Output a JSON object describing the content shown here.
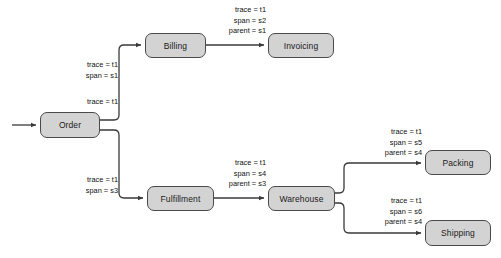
{
  "diagram": {
    "background_color": "#ffffff",
    "node_fill_color": "#d3d3d3",
    "node_border_color": "#4a4a4a",
    "edge_color": "#3a3a3a",
    "nodes": [
      {
        "id": "order",
        "label": "Order",
        "x": 40,
        "y": 112,
        "w": 60,
        "h": 26
      },
      {
        "id": "billing",
        "label": "Billing",
        "x": 145,
        "y": 33,
        "w": 61,
        "h": 25
      },
      {
        "id": "invoicing",
        "label": "Invoicing",
        "x": 268,
        "y": 33,
        "w": 66,
        "h": 25
      },
      {
        "id": "fulfillment",
        "label": "Fulfillment",
        "x": 147,
        "y": 186,
        "w": 67,
        "h": 25
      },
      {
        "id": "warehouse",
        "label": "Warehouse",
        "x": 268,
        "y": 186,
        "w": 67,
        "h": 25
      },
      {
        "id": "packing",
        "label": "Packing",
        "x": 425,
        "y": 150,
        "w": 66,
        "h": 25
      },
      {
        "id": "shipping",
        "label": "Shipping",
        "x": 425,
        "y": 220,
        "w": 66,
        "h": 26
      }
    ],
    "edge_labels": [
      {
        "id": "entry-order",
        "lines": [
          "trace = t1"
        ],
        "x": 56,
        "y": 97,
        "width": 62,
        "align": "right"
      },
      {
        "id": "order-billing",
        "lines": [
          "trace = t1",
          "span = s1"
        ],
        "x": 56,
        "y": 60,
        "width": 62,
        "align": "right"
      },
      {
        "id": "billing-invoicing",
        "lines": [
          "trace = t1",
          "span = s2",
          "parent = s1"
        ],
        "x": 196,
        "y": 5,
        "width": 70,
        "align": "right"
      },
      {
        "id": "order-fulfillment",
        "lines": [
          "trace = t1",
          "span = s3"
        ],
        "x": 56,
        "y": 175,
        "width": 62,
        "align": "right"
      },
      {
        "id": "fulfillment-warehouse",
        "lines": [
          "trace = t1",
          "span = s4",
          "parent = s3"
        ],
        "x": 196,
        "y": 158,
        "width": 70,
        "align": "right"
      },
      {
        "id": "warehouse-packing",
        "lines": [
          "trace = t1",
          "span = s5",
          "parent = s4"
        ],
        "x": 352,
        "y": 127,
        "width": 70,
        "align": "right"
      },
      {
        "id": "warehouse-shipping",
        "lines": [
          "trace = t1",
          "span = s6",
          "parent = s4"
        ],
        "x": 352,
        "y": 196,
        "width": 70,
        "align": "right"
      }
    ],
    "edges": [
      {
        "id": "entry-to-order",
        "from": "",
        "to": "order",
        "path": "M 12 125 L 36 125"
      },
      {
        "id": "order-to-billing",
        "from": "order",
        "to": "billing",
        "path": "M 100 120 L 114 120 Q 119 120 119 115 L 119 50 Q 119 45 124 45 L 141 45"
      },
      {
        "id": "billing-to-invoicing",
        "from": "billing",
        "to": "invoicing",
        "path": "M 206 45 L 264 45"
      },
      {
        "id": "order-to-fulfillment",
        "from": "order",
        "to": "fulfillment",
        "path": "M 100 130 L 114 130 Q 119 130 119 135 L 119 193 Q 119 198 124 198 L 143 198"
      },
      {
        "id": "fulfillment-to-warehouse",
        "from": "fulfillment",
        "to": "warehouse",
        "path": "M 214 198 L 264 198"
      },
      {
        "id": "warehouse-to-packing",
        "from": "warehouse",
        "to": "packing",
        "path": "M 335 193 L 339 193 Q 344 193 344 188 L 344 168 Q 344 163 349 163 L 421 163"
      },
      {
        "id": "warehouse-to-shipping",
        "from": "warehouse",
        "to": "shipping",
        "path": "M 335 203 L 339 203 Q 344 203 344 208 L 344 228 Q 344 233 349 233 L 421 233"
      }
    ]
  }
}
